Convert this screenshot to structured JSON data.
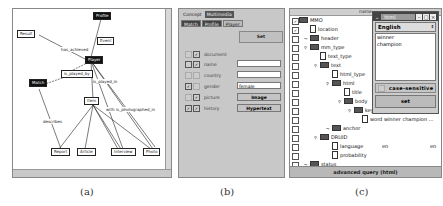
{
  "panel_a": {
    "nodes": [
      {
        "id": "profile",
        "label": "Profile",
        "style": "dark"
      },
      {
        "id": "result",
        "label": "Result",
        "style": "light"
      },
      {
        "id": "event",
        "label": "Event",
        "style": "light"
      },
      {
        "id": "player",
        "label": "Player",
        "style": "dark"
      },
      {
        "id": "match",
        "label": "Match",
        "style": "dark"
      },
      {
        "id": "is_played_by",
        "label": "is_played_by",
        "style": "light"
      },
      {
        "id": "item",
        "label": "Item",
        "style": "light"
      },
      {
        "id": "report",
        "label": "Report",
        "style": "light"
      },
      {
        "id": "article",
        "label": "Article",
        "style": "light"
      },
      {
        "id": "interview",
        "label": "Interview",
        "style": "light"
      },
      {
        "id": "photo",
        "label": "Photo",
        "style": "light"
      }
    ],
    "edge_labels": [
      "has_achieved",
      "is_played_in",
      "describes",
      "with",
      "is_photographed_in"
    ]
  },
  "panel_b": {
    "tabs_top": [
      "Concept",
      "Multimedia"
    ],
    "tabs_sub": [
      "Match",
      "Profile",
      "Player"
    ],
    "set_label": "Set",
    "fields": [
      {
        "label": "document",
        "checked": true,
        "value": null
      },
      {
        "label": "name",
        "checked": false,
        "value": ""
      },
      {
        "label": "country",
        "checked": false,
        "value": ""
      },
      {
        "label": "gender",
        "checked": true,
        "value": "female"
      },
      {
        "label": "picture",
        "checked": false,
        "button": "Image"
      },
      {
        "label": "history",
        "checked": true,
        "button": "Hypertext"
      }
    ]
  },
  "panel_c": {
    "column_header": "name",
    "tree": [
      {
        "label": "MMO",
        "type": "folder",
        "depth": 0
      },
      {
        "label": "location",
        "type": "doc",
        "depth": 1
      },
      {
        "label": "header",
        "type": "folder",
        "depth": 1
      },
      {
        "label": "mm_type",
        "type": "folder",
        "depth": 1
      },
      {
        "label": "text_type",
        "type": "doc",
        "depth": 2
      },
      {
        "label": "text",
        "type": "folder",
        "depth": 2
      },
      {
        "label": "html_type",
        "type": "doc",
        "depth": 3
      },
      {
        "label": "html",
        "type": "folder",
        "depth": 3
      },
      {
        "label": "title",
        "type": "doc",
        "depth": 4
      },
      {
        "label": "body",
        "type": "folder",
        "depth": 4
      },
      {
        "label": "keyw",
        "type": "folder",
        "depth": 5
      },
      {
        "label": "word winner champion ...",
        "type": "doc",
        "depth": 6
      },
      {
        "label": "anchor",
        "type": "folder",
        "depth": 3
      },
      {
        "label": "DRUID",
        "type": "folder",
        "depth": 2
      },
      {
        "label": "language",
        "type": "doc",
        "depth": 3,
        "value1": "en",
        "value2": "en"
      },
      {
        "label": "probability",
        "type": "doc",
        "depth": 3
      },
      {
        "label": "status",
        "type": "folder",
        "depth": 1
      }
    ],
    "status_bar": "advanced query (html)",
    "popup": {
      "title": "html",
      "language": "English",
      "terms": [
        "winner",
        "champion"
      ],
      "case_sensitive_label": "case-sensitive",
      "set_label": "set"
    }
  },
  "captions": [
    "(a)",
    "(b)",
    "(c)"
  ]
}
